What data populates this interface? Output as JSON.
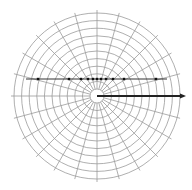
{
  "diagram": {
    "type": "polar-grid",
    "center": [
      97,
      96
    ],
    "inner_radius": 7,
    "outer_radius": 83,
    "ring_count": 10,
    "spoke_step_deg": 15,
    "grid_color": "#9a9a9a",
    "line_color": "#333333",
    "horizontal_line": {
      "y": 79,
      "x_start": 26,
      "x_end": 167
    },
    "points_x": [
      38,
      69,
      81,
      88,
      93,
      97,
      101,
      106,
      113,
      124,
      156
    ],
    "arrow": {
      "y": 96,
      "x_start": 97,
      "x_end": 186
    }
  }
}
